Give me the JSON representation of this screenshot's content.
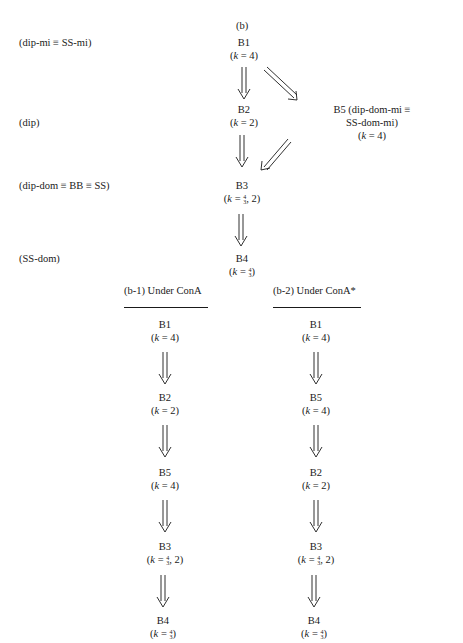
{
  "diagram": {
    "panel_label": "(b)",
    "level_labels": [
      "(dip-mi ≡ SS-mi)",
      "(dip)",
      "(dip-dom ≡ BB ≡ SS)",
      "(SS-dom)"
    ],
    "main": {
      "b1": {
        "name": "B1",
        "k": "4"
      },
      "b2": {
        "name": "B2",
        "k": "2"
      },
      "b5": {
        "name": "B5 (dip-dom-mi ≡ SS-dom-mi)",
        "k": "4"
      },
      "b3": {
        "name": "B3",
        "k_suffix": ", 2"
      },
      "b4": {
        "name": "B4"
      }
    },
    "sub1": {
      "title": "(b-1) Under ConA",
      "nodes": [
        {
          "name": "B1",
          "k": "4"
        },
        {
          "name": "B2",
          "k": "2"
        },
        {
          "name": "B5",
          "k": "4"
        },
        {
          "name": "B3",
          "k_suffix": ", 2"
        },
        {
          "name": "B4"
        }
      ]
    },
    "sub2": {
      "title": "(b-2) Under ConA*",
      "nodes": [
        {
          "name": "B1",
          "k": "4"
        },
        {
          "name": "B5",
          "k": "4"
        },
        {
          "name": "B2",
          "k": "2"
        },
        {
          "name": "B3",
          "k_suffix": ", 2"
        },
        {
          "name": "B4"
        }
      ]
    },
    "k_var": "k",
    "eq": " = ",
    "frac_num": "4",
    "frac_den": "3"
  }
}
